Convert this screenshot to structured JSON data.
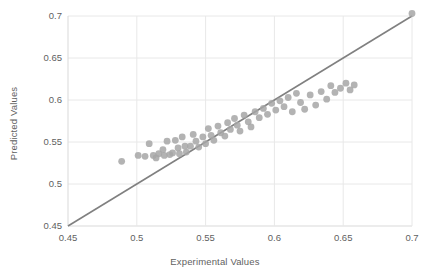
{
  "chart_data": {
    "type": "scatter",
    "title": "",
    "xlabel": "Experimental Values",
    "ylabel": "Predicted Values",
    "xlim": [
      0.45,
      0.7
    ],
    "ylim": [
      0.45,
      0.7
    ],
    "xticks": [
      "0.45",
      "0.5",
      "0.55",
      "0.6",
      "0.65",
      "0.7"
    ],
    "yticks": [
      "0.45",
      "0.5",
      "0.55",
      "0.6",
      "0.65",
      "0.7"
    ],
    "xtick_values": [
      0.45,
      0.5,
      0.55,
      0.6,
      0.65,
      0.7
    ],
    "ytick_values": [
      0.45,
      0.5,
      0.55,
      0.6,
      0.65,
      0.7
    ],
    "grid": true,
    "legend": "none",
    "marker_color": "#a6a6a6",
    "line_color": "#808080",
    "grid_color": "#e8e8e8",
    "axis_color": "#d9d9d9",
    "text_color": "#5f5f5f",
    "reference_line": {
      "name": "parity-line",
      "from": [
        0.45,
        0.45
      ],
      "to": [
        0.7,
        0.7
      ]
    },
    "series": [
      {
        "name": "Predicted vs Experimental",
        "points": [
          [
            0.489,
            0.527
          ],
          [
            0.501,
            0.534
          ],
          [
            0.506,
            0.533
          ],
          [
            0.509,
            0.548
          ],
          [
            0.512,
            0.534
          ],
          [
            0.514,
            0.531
          ],
          [
            0.516,
            0.536
          ],
          [
            0.519,
            0.541
          ],
          [
            0.52,
            0.534
          ],
          [
            0.522,
            0.551
          ],
          [
            0.524,
            0.535
          ],
          [
            0.526,
            0.537
          ],
          [
            0.528,
            0.552
          ],
          [
            0.53,
            0.543
          ],
          [
            0.531,
            0.536
          ],
          [
            0.533,
            0.556
          ],
          [
            0.535,
            0.545
          ],
          [
            0.536,
            0.538
          ],
          [
            0.539,
            0.545
          ],
          [
            0.541,
            0.559
          ],
          [
            0.543,
            0.551
          ],
          [
            0.545,
            0.544
          ],
          [
            0.548,
            0.556
          ],
          [
            0.55,
            0.548
          ],
          [
            0.552,
            0.566
          ],
          [
            0.554,
            0.558
          ],
          [
            0.556,
            0.552
          ],
          [
            0.559,
            0.569
          ],
          [
            0.561,
            0.561
          ],
          [
            0.564,
            0.557
          ],
          [
            0.566,
            0.573
          ],
          [
            0.568,
            0.565
          ],
          [
            0.571,
            0.578
          ],
          [
            0.573,
            0.57
          ],
          [
            0.575,
            0.563
          ],
          [
            0.578,
            0.582
          ],
          [
            0.581,
            0.574
          ],
          [
            0.583,
            0.568
          ],
          [
            0.586,
            0.586
          ],
          [
            0.589,
            0.579
          ],
          [
            0.592,
            0.59
          ],
          [
            0.595,
            0.583
          ],
          [
            0.598,
            0.596
          ],
          [
            0.601,
            0.588
          ],
          [
            0.604,
            0.599
          ],
          [
            0.607,
            0.592
          ],
          [
            0.61,
            0.603
          ],
          [
            0.613,
            0.586
          ],
          [
            0.616,
            0.608
          ],
          [
            0.619,
            0.597
          ],
          [
            0.622,
            0.589
          ],
          [
            0.626,
            0.606
          ],
          [
            0.63,
            0.594
          ],
          [
            0.634,
            0.61
          ],
          [
            0.638,
            0.601
          ],
          [
            0.641,
            0.617
          ],
          [
            0.644,
            0.609
          ],
          [
            0.648,
            0.614
          ],
          [
            0.652,
            0.62
          ],
          [
            0.655,
            0.612
          ],
          [
            0.658,
            0.618
          ],
          [
            0.7,
            0.703
          ]
        ]
      }
    ]
  }
}
